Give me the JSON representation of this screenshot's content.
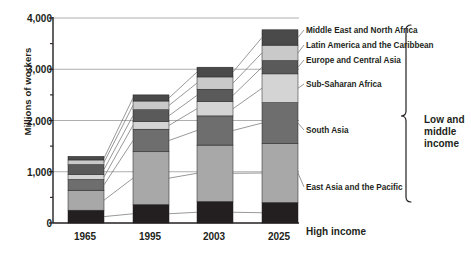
{
  "chart_data": {
    "type": "bar",
    "title": "",
    "subtitle": "",
    "xlabel": "",
    "ylabel": "Millions of workers",
    "categories": [
      "1965",
      "1995",
      "2003",
      "2025"
    ],
    "ylim": [
      0,
      4000
    ],
    "yticks": [
      0,
      1000,
      2000,
      3000,
      4000
    ],
    "ytick_labels": [
      "0",
      "1,000",
      "2,000",
      "3,000",
      "4,000"
    ],
    "minor_yticks": [
      500,
      1500,
      2500,
      3500
    ],
    "grid": true,
    "stacked": true,
    "legend_position": "right-callout",
    "series": [
      {
        "name": "High income",
        "color": "#231f20",
        "values": [
          250,
          360,
          420,
          400
        ]
      },
      {
        "name": "East Asia and the Pacific",
        "color": "#a8a8a8",
        "values": [
          390,
          1030,
          1100,
          1150
        ]
      },
      {
        "name": "South Asia",
        "color": "#6e6e6e",
        "values": [
          210,
          440,
          570,
          800
        ]
      },
      {
        "name": "Sub-Saharan Africa",
        "color": "#d4d4d4",
        "values": [
          100,
          150,
          280,
          560
        ]
      },
      {
        "name": "Europe and Central Asia",
        "color": "#5a5a5a",
        "values": [
          190,
          230,
          240,
          260
        ]
      },
      {
        "name": "Latin America and the Caribbean",
        "color": "#c9c9c9",
        "values": [
          90,
          170,
          240,
          300
        ]
      },
      {
        "name": "Middle East and North Africa",
        "color": "#4a4a4a",
        "values": [
          70,
          120,
          190,
          300
        ]
      }
    ],
    "totals": [
      1300,
      2500,
      3040,
      3770
    ],
    "annotations": [
      {
        "text": "Low and middle income",
        "type": "bracket",
        "position": "right"
      },
      {
        "text": "High income",
        "type": "callout",
        "position": "right"
      }
    ]
  },
  "axis": {
    "y_title": "Millions of workers",
    "y_tick_labels": [
      "4,000",
      "3,000",
      "2,000",
      "1,000",
      "0"
    ],
    "x_tick_labels": [
      "1965",
      "1995",
      "2003",
      "2025"
    ]
  },
  "legend": {
    "items": [
      {
        "label": "Middle East and North Africa"
      },
      {
        "label": "Latin America and the Caribbean"
      },
      {
        "label": "Europe and Central Asia"
      },
      {
        "label": "Sub-Saharan Africa"
      },
      {
        "label": "South Asia"
      },
      {
        "label": "East Asia and the Pacific"
      },
      {
        "label": "High income"
      }
    ]
  },
  "bracket": {
    "line1": "Low and",
    "line2": "middle",
    "line3": "income"
  },
  "colors": {
    "high_income": "#231f20",
    "east_asia_pacific": "#a8a8a8",
    "south_asia": "#6e6e6e",
    "sub_saharan_africa": "#d4d4d4",
    "europe_central_asia": "#5a5a5a",
    "latin_america_caribbean": "#c9c9c9",
    "middle_east_north_africa": "#4a4a4a",
    "axis": "#231f20",
    "grid": "#9a9a9a",
    "background": "#ffffff"
  }
}
